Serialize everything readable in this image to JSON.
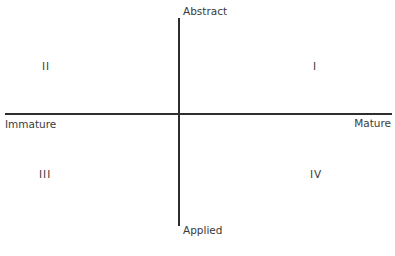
{
  "diagram": {
    "type": "quadrant",
    "axes": {
      "vertical": {
        "top_label": "Abstract",
        "bottom_label": "Applied"
      },
      "horizontal": {
        "left_label": "Immature",
        "right_label": "Mature"
      }
    },
    "quadrants": {
      "top_right": "I",
      "top_left": "II",
      "bottom_left": "III",
      "bottom_right": "IV"
    },
    "colors": {
      "axis": "#2e2e2e",
      "text": "#3a3a3a",
      "background": "#ffffff"
    }
  }
}
